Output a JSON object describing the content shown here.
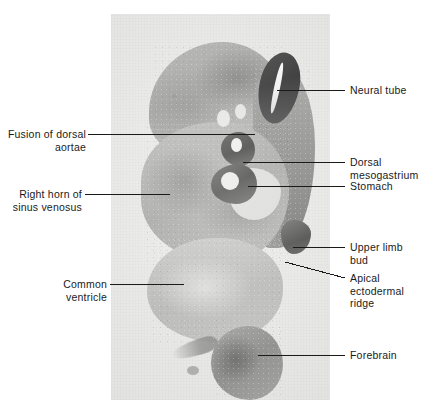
{
  "figure": {
    "type": "histology-micrograph-labeled-diagram",
    "plate": {
      "background_color": "#e9e9e7",
      "left": 111,
      "top": 14,
      "width": 219,
      "height": 386
    },
    "page_background": "#ffffff",
    "line_color": "#1a1a1a",
    "text_color": "#1a1a1a"
  },
  "labels": {
    "neural_tube": "Neural tube",
    "fusion_of_dorsal_aortae": "Fusion of dorsal\naortae",
    "dorsal_mesogastrium": "Dorsal\nmesogastrium",
    "stomach": "Stomach",
    "right_horn_of_sinus_venosus": "Right horn of\nsinus venosus",
    "upper_limb_bud": "Upper limb\nbud",
    "apical_ectodermal_ridge": "Apical\nectodermal\nridge",
    "common_ventricle": "Common\nventricle",
    "forebrain": "Forebrain"
  },
  "callouts": [
    {
      "key": "neural_tube",
      "side": "right",
      "text": "Neural tube",
      "line": {
        "x1": 277,
        "y1": 90,
        "x2": 345,
        "y2": 90
      },
      "text_x": 350,
      "text_y": 84
    },
    {
      "key": "fusion_of_dorsal_aortae",
      "side": "left",
      "text": "Fusion of dorsal aortae",
      "line": {
        "x1": 88,
        "y1": 134,
        "x2": 255,
        "y2": 134
      },
      "text_x": 4,
      "text_y": 128
    },
    {
      "key": "dorsal_mesogastrium",
      "side": "right",
      "text": "Dorsal mesogastrium",
      "line": {
        "x1": 243,
        "y1": 162,
        "x2": 345,
        "y2": 162
      },
      "text_x": 350,
      "text_y": 156
    },
    {
      "key": "stomach",
      "side": "right",
      "text": "Stomach",
      "line": {
        "x1": 248,
        "y1": 186,
        "x2": 345,
        "y2": 186
      },
      "text_x": 350,
      "text_y": 180
    },
    {
      "key": "right_horn_of_sinus_venosus",
      "side": "left",
      "text": "Right horn of sinus venosus",
      "line": {
        "x1": 85,
        "y1": 194,
        "x2": 170,
        "y2": 194
      },
      "text_x": 4,
      "text_y": 188
    },
    {
      "key": "upper_limb_bud",
      "side": "right",
      "text": "Upper limb bud",
      "line": {
        "x1": 293,
        "y1": 247,
        "x2": 345,
        "y2": 247
      },
      "text_x": 350,
      "text_y": 241
    },
    {
      "key": "apical_ectodermal_ridge",
      "side": "right",
      "text": "Apical ectodermal ridge",
      "line": {
        "x1": 285,
        "y1": 262,
        "x2": 345,
        "y2": 278
      },
      "text_x": 350,
      "text_y": 272
    },
    {
      "key": "common_ventricle",
      "side": "left",
      "text": "Common ventricle",
      "line": {
        "x1": 110,
        "y1": 284,
        "x2": 184,
        "y2": 284
      },
      "text_x": 4,
      "text_y": 278
    },
    {
      "key": "forebrain",
      "side": "right",
      "text": "Forebrain",
      "line": {
        "x1": 258,
        "y1": 355,
        "x2": 345,
        "y2": 355
      },
      "text_x": 350,
      "text_y": 349
    }
  ],
  "structures": [
    {
      "name": "neural-tube",
      "description": "dark oval with bright central canal, upper right of section"
    },
    {
      "name": "dorsal-aortae",
      "description": "paired pale lumina fusing near midline"
    },
    {
      "name": "dorsal-mesogastrium",
      "description": "dark mesentery loop above stomach"
    },
    {
      "name": "stomach",
      "description": "dark gut loop with pale lumen"
    },
    {
      "name": "sinus-venosus-right-horn",
      "description": "large speckled mass left of midline"
    },
    {
      "name": "upper-limb-bud",
      "description": "dark flank projection on right"
    },
    {
      "name": "apical-ectodermal-ridge",
      "description": "dark rim at distal tip of limb bud"
    },
    {
      "name": "common-ventricle",
      "description": "pale rounded lobe at lower left"
    },
    {
      "name": "forebrain",
      "description": "detached rounded vesicle at bottom"
    }
  ]
}
